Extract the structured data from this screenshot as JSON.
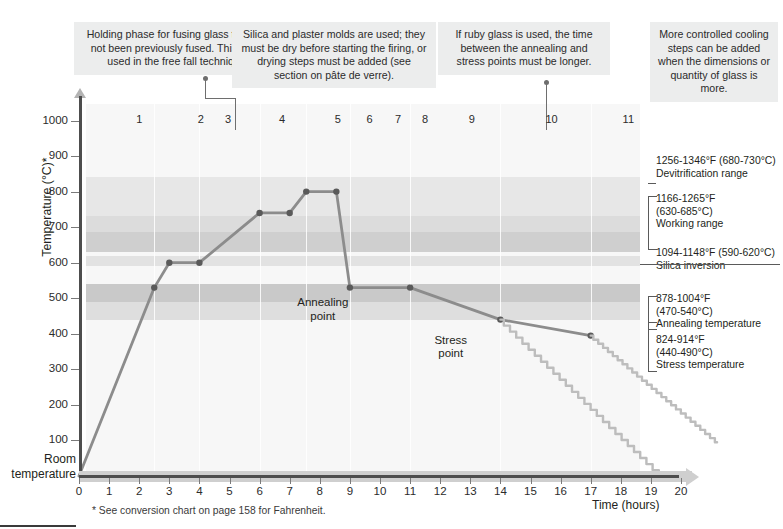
{
  "notes": [
    {
      "id": "holding-phase",
      "text": "Holding phase for fusing glass that has not been previously fused. This is not used in the free fall technique."
    },
    {
      "id": "molds",
      "text": "Silica and plaster molds are used; they must be dry before starting the firing, or drying steps must be added (see section on pâte de verre)."
    },
    {
      "id": "ruby-glass",
      "text": "If ruby glass is used, the time between the annealing and stress points must be longer."
    },
    {
      "id": "controlled-cooling",
      "text": "More controlled cooling steps can be added when the dimensions or quantity of glass is more."
    }
  ],
  "axes": {
    "y_title": "Temperature (°C)*",
    "x_title": "Time (hours)",
    "room_temperature_label": "Room\ntemperature",
    "y_ticks": [
      1000,
      900,
      800,
      700,
      600,
      500,
      400,
      300,
      200,
      100
    ],
    "x_ticks": [
      0,
      1,
      2,
      3,
      4,
      5,
      6,
      7,
      8,
      9,
      10,
      11,
      12,
      13,
      14,
      15,
      16,
      17,
      18,
      19,
      20
    ]
  },
  "footnote": "* See conversion chart on page 158 for Fahrenheit.",
  "step_numbers": [
    {
      "label": "1",
      "x": 2.0
    },
    {
      "label": "2",
      "x": 4.05
    },
    {
      "label": "3",
      "x": 4.95
    },
    {
      "label": "4",
      "x": 6.75
    },
    {
      "label": "5",
      "x": 8.6
    },
    {
      "label": "6",
      "x": 9.65
    },
    {
      "label": "7",
      "x": 10.6
    },
    {
      "label": "8",
      "x": 11.5
    },
    {
      "label": "9",
      "x": 13.05
    },
    {
      "label": "10",
      "x": 15.7
    },
    {
      "label": "11",
      "x": 18.25
    }
  ],
  "inline_labels": [
    {
      "id": "annealing-point",
      "text": "Annealing\npoint",
      "x": 8.1,
      "y": 505
    },
    {
      "id": "stress-point",
      "text": "Stress\npoint",
      "x": 12.35,
      "y": 400
    }
  ],
  "ranges": [
    {
      "id": "devitrification",
      "f": "1256-1346°F (680-730°C)",
      "c_inline": true,
      "name": "Devitrification range",
      "c_min": 680,
      "c_max": 730,
      "shade": "#dcdcdc"
    },
    {
      "id": "working",
      "f": "1166-1265°F",
      "c": "(630-685°C)",
      "name": "Working range",
      "c_min": 630,
      "c_max": 685,
      "shade": "#cfcfcf"
    },
    {
      "id": "silica-inversion",
      "f": "1094-1148°F (590-620°C)",
      "c_inline": true,
      "name": "Silica inversion",
      "c_min": 590,
      "c_max": 620,
      "shade": "#e2e2e2"
    },
    {
      "id": "annealing",
      "f": "878-1004°F",
      "c": "(470-540°C)",
      "name": "Annealing temperature",
      "c_min": 470,
      "c_max": 540,
      "shade": "#c9c9c9"
    },
    {
      "id": "stress",
      "f": "824-914°F",
      "c": "(440-490°C)",
      "name": "Stress temperature",
      "c_min": 440,
      "c_max": 490,
      "shade": "#dedede"
    }
  ],
  "chart_data": {
    "type": "line",
    "xlabel": "Time (hours)",
    "ylabel": "Temperature (°C)*",
    "xlim": [
      0,
      21
    ],
    "ylim": [
      0,
      1040
    ],
    "grid": false,
    "legend": "none",
    "series": [
      {
        "name": "Firing schedule",
        "marker": true,
        "color": "#8c8c8c",
        "points": [
          {
            "x": 0.0,
            "y": 0
          },
          {
            "x": 2.5,
            "y": 530
          },
          {
            "x": 3.0,
            "y": 600
          },
          {
            "x": 4.0,
            "y": 600
          },
          {
            "x": 6.0,
            "y": 740
          },
          {
            "x": 7.0,
            "y": 740
          },
          {
            "x": 7.55,
            "y": 800
          },
          {
            "x": 8.55,
            "y": 800
          },
          {
            "x": 9.0,
            "y": 530
          },
          {
            "x": 11.0,
            "y": 530
          },
          {
            "x": 14.0,
            "y": 440
          },
          {
            "x": 17.0,
            "y": 395
          }
        ]
      },
      {
        "name": "Controlled cooling staircase A",
        "marker": false,
        "color": "#bdbdbd",
        "style": "staircase",
        "points": [
          {
            "x": 14.0,
            "y": 440
          },
          {
            "x": 19.35,
            "y": 0
          }
        ]
      },
      {
        "name": "Controlled cooling staircase B",
        "marker": false,
        "color": "#bdbdbd",
        "style": "staircase",
        "points": [
          {
            "x": 17.0,
            "y": 395
          },
          {
            "x": 21.2,
            "y": 95
          }
        ]
      }
    ]
  }
}
